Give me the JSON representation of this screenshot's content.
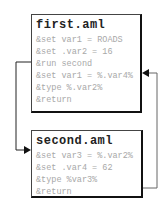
{
  "diagram": {
    "files": [
      {
        "title": "first.aml",
        "lines": [
          "&set var1 = ROADS",
          "&set .var2 = 16",
          "&run second",
          "&set var1 = %.var4%",
          "&type %.var2%",
          "&return"
        ]
      },
      {
        "title": "second.aml",
        "lines": [
          "&set var3 = %.var2%",
          "&set .var4 = 62",
          "&type %var3%",
          "&return"
        ]
      }
    ],
    "connectors": [
      {
        "from": "first.aml: &run second",
        "to": "second.aml: start"
      },
      {
        "from": "second.aml: &return",
        "to": "first.aml: &set var1 = %.var4%"
      }
    ],
    "colors": {
      "border": "#111111",
      "code_text": "#a8a8a8",
      "title_text": "#222222",
      "connector": "#222222"
    }
  }
}
